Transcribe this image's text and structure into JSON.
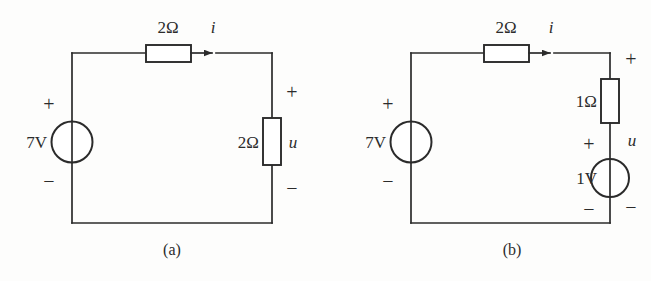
{
  "figure": {
    "type": "circuit-diagram",
    "background_color": "#fdfdfc",
    "line_color": "#2b2b2b",
    "subfigures": [
      {
        "id": "a",
        "caption": "(a)",
        "elements": {
          "source": {
            "label": "7V",
            "plus": "+",
            "minus": "−",
            "kind": "voltage-source"
          },
          "series_resistor": {
            "label": "2Ω"
          },
          "current": {
            "label": "i"
          },
          "load_resistor": {
            "label": "2Ω",
            "voltage_label": "u",
            "plus": "+",
            "minus": "−"
          }
        }
      },
      {
        "id": "b",
        "caption": "(b)",
        "elements": {
          "source": {
            "label": "7V",
            "plus": "+",
            "minus": "−",
            "kind": "voltage-source"
          },
          "series_resistor": {
            "label": "2Ω"
          },
          "current": {
            "label": "i"
          },
          "branch_resistor": {
            "label": "1Ω"
          },
          "branch_source": {
            "label": "1V",
            "plus": "+",
            "minus": "−",
            "kind": "voltage-source"
          },
          "branch_voltage": {
            "label": "u",
            "plus": "+",
            "minus": "−"
          }
        }
      }
    ]
  },
  "a": {
    "source_label": "7V",
    "source_plus": "+",
    "source_minus": "−",
    "series_resistor_label": "2Ω",
    "current_label": "i",
    "load_resistor_label": "2Ω",
    "load_voltage_label": "u",
    "load_plus": "+",
    "load_minus": "−",
    "caption": "(a)"
  },
  "b": {
    "source_label": "7V",
    "source_plus": "+",
    "source_minus": "−",
    "series_resistor_label": "2Ω",
    "current_label": "i",
    "branch_resistor_label": "1Ω",
    "branch_source_label": "1V",
    "branch_source_plus": "+",
    "branch_source_minus": "−",
    "branch_voltage_label": "u",
    "branch_plus": "+",
    "branch_minus": "−",
    "caption": "(b)"
  }
}
